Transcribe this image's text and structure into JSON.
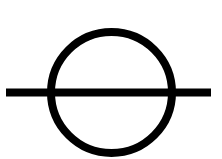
{
  "canvas": {
    "width": 222,
    "height": 159,
    "background_color": "#ffffff"
  },
  "figure": {
    "name": "barred-circle-symbol",
    "stroke_color": "#000000",
    "fill_color": "none",
    "text_labels": []
  },
  "shapes": {
    "circle": {
      "name": "circle-outline",
      "center_x": 111.5,
      "center_y": 92.5,
      "radius": 60.5,
      "stroke_width": 8,
      "stroke_color": "#000000",
      "fill": "none"
    },
    "bar": {
      "name": "horizontal-bar",
      "x1": 6,
      "y1": 92.5,
      "x2": 211,
      "y2": 92.5,
      "stroke_width": 8,
      "stroke_color": "#000000",
      "linecap": "butt"
    }
  }
}
